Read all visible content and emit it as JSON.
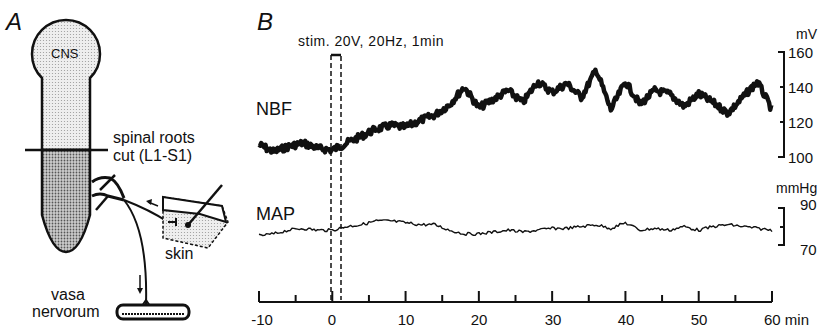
{
  "panel_a": {
    "letter": "A",
    "cns_label": "CNS",
    "cut_label_line1": "spinal roots",
    "cut_label_line2": "cut (L1-S1)",
    "skin_label": "skin",
    "target_label_line1": "vasa",
    "target_label_line2": "nervorum"
  },
  "panel_b": {
    "letter": "B",
    "stim_label": "stim. 20V, 20Hz, 1min",
    "nbf_label": "NBF",
    "map_label": "MAP",
    "nbf_unit": "mV",
    "map_unit": "mmHg",
    "nbf_ticks": [
      "160",
      "140",
      "120",
      "100"
    ],
    "map_ticks": [
      "90",
      "70"
    ],
    "x_ticks": [
      "-10",
      "0",
      "10",
      "20",
      "30",
      "40",
      "50",
      "60 min"
    ]
  },
  "chart_data": [
    {
      "type": "line",
      "title": "NBF",
      "xlabel": "min",
      "ylabel": "mV",
      "xlim": [
        -10,
        60
      ],
      "ylim": [
        100,
        160
      ],
      "x": [
        -10,
        -8,
        -6,
        -4,
        -2,
        0,
        2,
        4,
        6,
        8,
        10,
        12,
        14,
        16,
        18,
        20,
        22,
        24,
        26,
        28,
        30,
        32,
        34,
        36,
        38,
        40,
        42,
        44,
        46,
        48,
        50,
        52,
        54,
        56,
        58,
        60
      ],
      "values": [
        107,
        103,
        106,
        108,
        105,
        104,
        108,
        112,
        116,
        118,
        117,
        121,
        124,
        130,
        140,
        128,
        133,
        138,
        131,
        143,
        137,
        142,
        134,
        150,
        127,
        143,
        130,
        138,
        136,
        129,
        136,
        131,
        125,
        134,
        143,
        127
      ],
      "annotations": [
        "stim. 20V, 20Hz, 1min (0 to 1 min)"
      ],
      "grid": false
    },
    {
      "type": "line",
      "title": "MAP",
      "xlabel": "min",
      "ylabel": "mmHg",
      "xlim": [
        -10,
        60
      ],
      "ylim": [
        70,
        90
      ],
      "x": [
        -10,
        -8,
        -6,
        -4,
        -2,
        0,
        2,
        4,
        6,
        8,
        10,
        12,
        14,
        16,
        18,
        20,
        22,
        24,
        26,
        28,
        30,
        32,
        34,
        36,
        38,
        40,
        42,
        44,
        46,
        48,
        50,
        52,
        54,
        56,
        58,
        60
      ],
      "values": [
        75,
        76,
        78,
        79,
        78,
        78,
        80,
        81,
        83,
        83,
        82,
        81,
        81,
        78,
        76,
        76,
        77,
        78,
        77,
        78,
        79,
        79,
        80,
        81,
        79,
        82,
        78,
        79,
        78,
        80,
        78,
        80,
        81,
        80,
        79,
        78
      ],
      "grid": false
    }
  ]
}
